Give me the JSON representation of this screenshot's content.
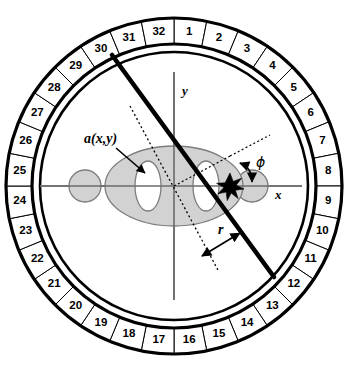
{
  "figure": {
    "type": "diagram"
  },
  "detector_ring": {
    "name": "detector-ring",
    "segment_count": 32,
    "labels": [
      "1",
      "2",
      "3",
      "4",
      "5",
      "6",
      "7",
      "8",
      "9",
      "10",
      "11",
      "12",
      "13",
      "14",
      "15",
      "16",
      "17",
      "18",
      "19",
      "20",
      "21",
      "22",
      "23",
      "24",
      "25",
      "26",
      "27",
      "28",
      "29",
      "30",
      "31",
      "32"
    ],
    "outer_radius": 168,
    "inner_radius": 142,
    "start_angle_deg": -90,
    "colors": {
      "cell_fill": "#ffffff",
      "stroke": "#000000"
    }
  },
  "field_of_view": {
    "name": "inner-circle",
    "radius": 134,
    "stroke": "#000000"
  },
  "axes": {
    "x_label": "x",
    "y_label": "y",
    "origin": {
      "x": 174,
      "y": 186
    },
    "color": "#6b6b6b"
  },
  "phantom": {
    "attenuation_label": "a(x,y)",
    "fill": "#d2d2d2",
    "void_fill": "#ffffff",
    "stroke": "#7d7d7d",
    "shapes": [
      {
        "name": "main-ellipse",
        "kind": "ellipse",
        "cx": 174,
        "cy": 186,
        "rx": 69,
        "ry": 40,
        "role": "body"
      },
      {
        "name": "void-ellipse-left",
        "kind": "ellipse",
        "cx": 148,
        "cy": 186,
        "rx": 13,
        "ry": 25,
        "role": "void"
      },
      {
        "name": "void-ellipse-right",
        "kind": "ellipse",
        "cx": 206,
        "cy": 186,
        "rx": 13,
        "ry": 25,
        "role": "void"
      },
      {
        "name": "satellite-circle-left",
        "kind": "circle",
        "cx": 85,
        "cy": 186,
        "r": 16,
        "role": "body"
      },
      {
        "name": "satellite-circle-right",
        "kind": "circle",
        "cx": 252,
        "cy": 186,
        "r": 16,
        "role": "body"
      }
    ]
  },
  "beam": {
    "name": "projection-ray",
    "label": "",
    "start": {
      "x": 112,
      "y": 55
    },
    "end": {
      "x": 274,
      "y": 277
    },
    "stroke": "#000000",
    "width": 4.6
  },
  "ray_parameters": {
    "radial_offset_label": "r",
    "angle_label": "ϕ"
  },
  "marker": {
    "name": "ray-axis-intersection",
    "x": 230,
    "y": 186
  }
}
